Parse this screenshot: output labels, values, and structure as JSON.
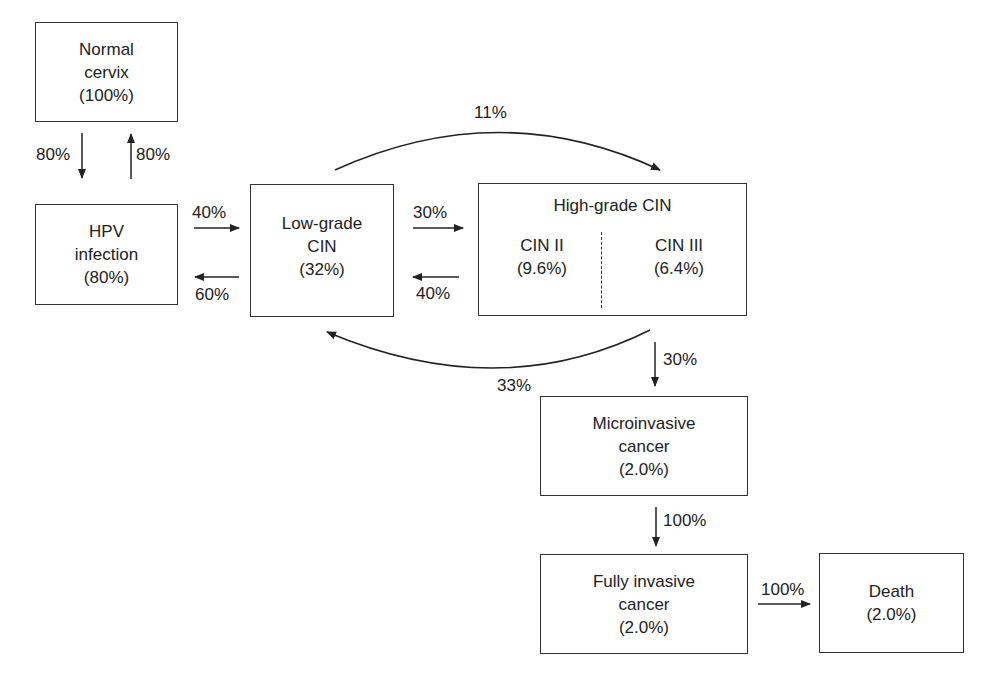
{
  "nodes": {
    "normal": {
      "line1": "Normal",
      "line2": "cervix",
      "value": "(100%)"
    },
    "hpv": {
      "line1": "HPV",
      "line2": "infection",
      "value": "(80%)"
    },
    "lowgrade": {
      "line1": "Low-grade",
      "line2": "CIN",
      "value": "(32%)"
    },
    "highgrade": {
      "title": "High-grade CIN",
      "cin2": {
        "label": "CIN II",
        "value": "(9.6%)"
      },
      "cin3": {
        "label": "CIN III",
        "value": "(6.4%)"
      }
    },
    "micro": {
      "line1": "Microinvasive",
      "line2": "cancer",
      "value": "(2.0%)"
    },
    "fully": {
      "line1": "Fully invasive",
      "line2": "cancer",
      "value": "(2.0%)"
    },
    "death": {
      "line1": "Death",
      "value": "(2.0%)"
    }
  },
  "edges": {
    "normal_to_hpv": "80%",
    "hpv_to_normal": "80%",
    "hpv_to_low": "40%",
    "low_to_hpv": "60%",
    "low_to_high": "30%",
    "high_to_low": "40%",
    "low_to_high_arc": "11%",
    "high_to_low_arc": "33%",
    "high_to_micro": "30%",
    "micro_to_fully": "100%",
    "fully_to_death": "100%"
  }
}
